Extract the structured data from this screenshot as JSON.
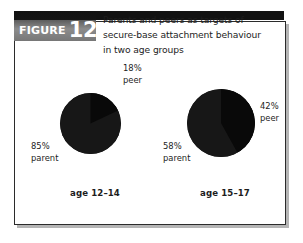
{
  "figure": {
    "label_word": "FIGURE",
    "label_number": "12.3",
    "caption_line1": "Parents and peers as targets of",
    "caption_line2": "secure-base attachment behaviour",
    "caption_line3": "in two age groups"
  },
  "colors": {
    "pie_parent": "#171717",
    "pie_peer": "#090909",
    "frame_border": "#2b2b2b",
    "header_bar": "#121212",
    "text": "#1d1d1d"
  },
  "labels": {
    "left_peer_pct": "18%",
    "left_peer_name": "peer",
    "left_parent_pct": "85%",
    "left_parent_name": "parent",
    "right_peer_pct": "42%",
    "right_peer_name": "peer",
    "right_parent_pct": "58%",
    "right_parent_name": "parent",
    "left_group": "age 12–14",
    "right_group": "age 15–17"
  },
  "chart_data": {
    "type": "pie",
    "title": "Parents and peers as targets of secure-base attachment behaviour in two age groups",
    "charts": [
      {
        "name": "age 12-14",
        "group_label": "age 12–14",
        "categories": [
          "parent",
          "peer"
        ],
        "values": [
          85,
          18
        ],
        "labels": [
          "85% parent",
          "18% peer"
        ],
        "slice_start_angle_deg": 0,
        "peer_wedge_deg": 65
      },
      {
        "name": "age 15-17",
        "group_label": "age 15–17",
        "categories": [
          "parent",
          "peer"
        ],
        "values": [
          58,
          42
        ],
        "labels": [
          "58% parent",
          "42% peer"
        ],
        "slice_start_angle_deg": 0,
        "peer_wedge_deg": 151
      }
    ],
    "xlabel": "",
    "ylabel": "",
    "legend": "none",
    "grid": false
  }
}
